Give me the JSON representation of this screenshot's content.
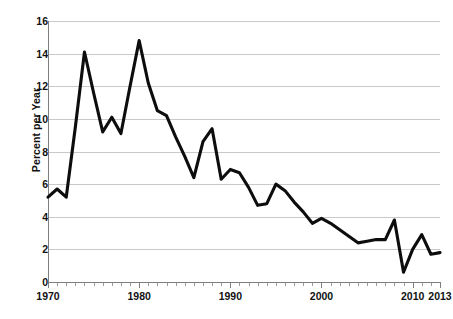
{
  "chart_data": {
    "type": "line",
    "title": "",
    "xlabel": "",
    "ylabel": "Percent per Year",
    "xlim": [
      1970,
      2013
    ],
    "ylim": [
      0,
      16
    ],
    "grid": true,
    "legend": false,
    "y_ticks": [
      0,
      2,
      4,
      6,
      8,
      10,
      12,
      14,
      16
    ],
    "y_tick_labels": [
      "0",
      "2",
      "4",
      "6",
      "8",
      "10",
      "12",
      "14",
      "16"
    ],
    "x_tick_labels": [
      "1970",
      "1980",
      "1990",
      "2000",
      "2010",
      "2013"
    ],
    "x_tick_values": [
      1970,
      1980,
      1990,
      2000,
      2010,
      2013
    ],
    "x_minor_tick_step": 1,
    "series": [
      {
        "name": "Percent per Year",
        "color": "#0d0d0d",
        "line_width": 3.1,
        "x": [
          1970,
          1971,
          1972,
          1973,
          1974,
          1975,
          1976,
          1977,
          1978,
          1979,
          1980,
          1981,
          1982,
          1983,
          1984,
          1985,
          1986,
          1987,
          1988,
          1989,
          1990,
          1991,
          1992,
          1993,
          1994,
          1995,
          1996,
          1997,
          1998,
          1999,
          2000,
          2001,
          2002,
          2003,
          2004,
          2005,
          2006,
          2007,
          2008,
          2009,
          2010,
          2011,
          2012,
          2013
        ],
        "values": [
          5.2,
          5.7,
          5.2,
          9.5,
          14.1,
          11.6,
          9.2,
          10.1,
          9.1,
          12.0,
          14.8,
          12.2,
          10.5,
          10.2,
          8.9,
          7.7,
          6.4,
          8.6,
          9.4,
          6.3,
          6.9,
          6.7,
          5.8,
          4.7,
          4.8,
          6.0,
          5.6,
          4.9,
          4.3,
          3.6,
          3.9,
          3.6,
          3.2,
          2.8,
          2.4,
          2.5,
          2.6,
          2.6,
          3.8,
          0.6,
          2.0,
          2.9,
          1.7,
          1.8
        ]
      }
    ]
  },
  "plot": {
    "left": 48,
    "right": 440,
    "top": 21,
    "bottom": 282
  }
}
